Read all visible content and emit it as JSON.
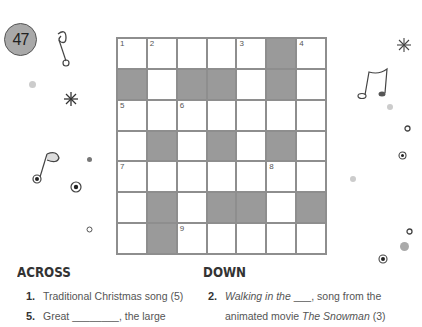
{
  "puzzle_number": "47",
  "grid": {
    "rows": 7,
    "cols": 7,
    "cells": [
      [
        "1",
        "2",
        "",
        "",
        "3",
        "#",
        "4"
      ],
      [
        "#",
        "",
        "#",
        "#",
        "",
        "#",
        ""
      ],
      [
        "5",
        "",
        "6",
        "",
        "",
        "",
        ""
      ],
      [
        "",
        "#",
        "",
        "#",
        "",
        "#",
        ""
      ],
      [
        "7",
        "",
        "",
        "",
        "",
        "8",
        ""
      ],
      [
        "",
        "#",
        "",
        "#",
        "#",
        "",
        "#"
      ],
      [
        "",
        "#",
        "9",
        "",
        "",
        "",
        ""
      ]
    ]
  },
  "across": {
    "heading": "ACROSS",
    "clues": [
      {
        "num": "1.",
        "text": "Traditional Christmas song (5)"
      },
      {
        "num": "5.",
        "text": "Great ________, the large"
      }
    ]
  },
  "down": {
    "heading": "DOWN",
    "clues": [
      {
        "num": "2.",
        "text_italic": "Walking in the",
        "text_rest": " ___, song from the",
        "line2_a": "animated movie ",
        "line2_italic": "The Snowman",
        "line2_b": " (3)"
      }
    ]
  }
}
